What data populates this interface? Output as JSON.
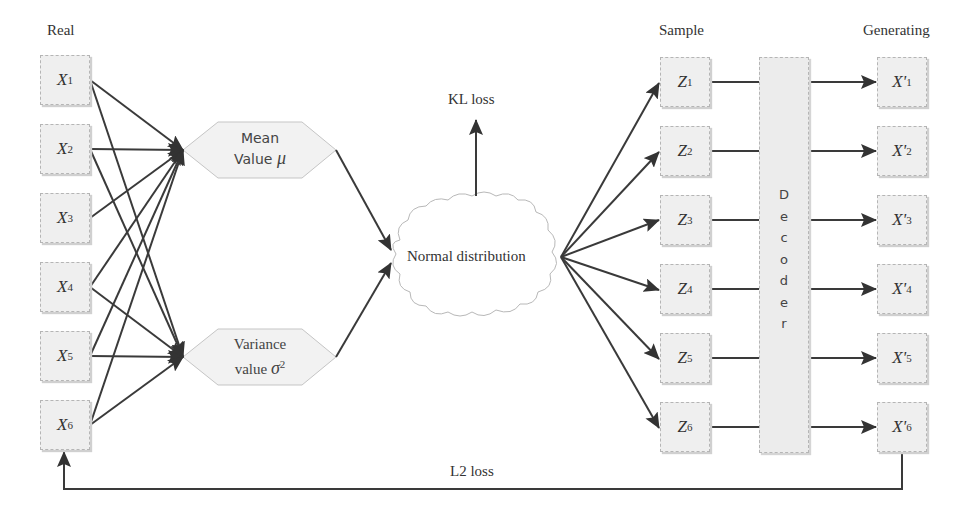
{
  "labels": {
    "real": "Real",
    "sample": "Sample",
    "generating": "Generating",
    "kl_loss": "KL loss",
    "l2_loss": "L2 loss",
    "normal_distribution": "Normal distribution"
  },
  "inputs": [
    {
      "sym": "X",
      "sub": "1"
    },
    {
      "sym": "X",
      "sub": "2"
    },
    {
      "sym": "X",
      "sub": "3"
    },
    {
      "sym": "X",
      "sub": "4"
    },
    {
      "sym": "X",
      "sub": "5"
    },
    {
      "sym": "X",
      "sub": "6"
    }
  ],
  "latents": [
    {
      "sym": "Z",
      "sub": "1"
    },
    {
      "sym": "Z",
      "sub": "2"
    },
    {
      "sym": "Z",
      "sub": "3"
    },
    {
      "sym": "Z",
      "sub": "4"
    },
    {
      "sym": "Z",
      "sub": "5"
    },
    {
      "sym": "Z",
      "sub": "6"
    }
  ],
  "outputs": [
    {
      "sym": "X'",
      "sub": "1"
    },
    {
      "sym": "X'",
      "sub": "2"
    },
    {
      "sym": "X'",
      "sub": "3"
    },
    {
      "sym": "X'",
      "sub": "4"
    },
    {
      "sym": "X'",
      "sub": "5"
    },
    {
      "sym": "X'",
      "sub": "6"
    }
  ],
  "mean_node": {
    "line1": "Mean",
    "line2": "Value",
    "symbol": "μ"
  },
  "variance_node": {
    "line1": "Variance",
    "line2": "value",
    "symbol": "σ",
    "sup": "2"
  },
  "decoder": {
    "letters": [
      "D",
      "e",
      "c",
      "o",
      "d",
      "e",
      "r"
    ]
  },
  "colors": {
    "line": "#3a3a3a",
    "box_fill": "#efefef",
    "box_border": "#b5b5b5",
    "text": "#333333"
  }
}
